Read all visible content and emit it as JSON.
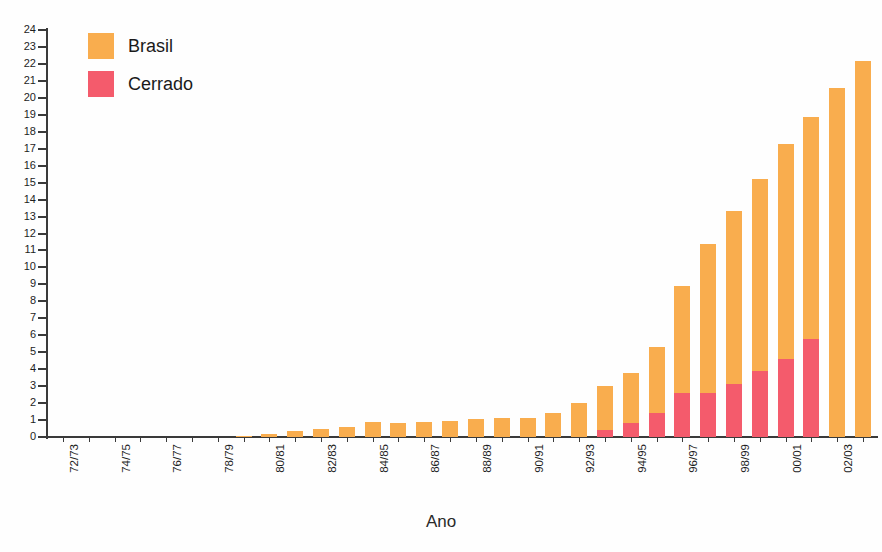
{
  "chart_data": {
    "type": "bar",
    "stacked": true,
    "title": "",
    "xlabel": "Ano",
    "ylabel": "",
    "ylim": [
      0,
      24
    ],
    "ytick_step": 1,
    "grid": false,
    "legend_position": "top-left",
    "categories": [
      "72/73",
      "73/74",
      "74/75",
      "75/76",
      "76/77",
      "77/78",
      "78/79",
      "79/80",
      "80/81",
      "81/82",
      "82/83",
      "83/84",
      "84/85",
      "85/86",
      "86/87",
      "87/88",
      "88/89",
      "89/90",
      "90/91",
      "91/92",
      "92/93",
      "93/94",
      "94/95",
      "95/96",
      "96/97",
      "97/98",
      "98/99",
      "99/00",
      "00/01",
      "01/02",
      "02/03",
      "03/04"
    ],
    "xtick_labels_shown": [
      "72/73",
      "74/75",
      "76/77",
      "78/79",
      "80/81",
      "82/83",
      "84/85",
      "86/87",
      "88/89",
      "90/91",
      "92/93",
      "94/95",
      "96/97",
      "98/99",
      "00/01",
      "02/03"
    ],
    "series": [
      {
        "name": "Brasil",
        "color": "#F9AD4E",
        "values": [
          0.0,
          0.0,
          0.0,
          0.0,
          0.0,
          0.0,
          0.0,
          0.05,
          0.2,
          0.35,
          0.5,
          0.6,
          0.9,
          0.85,
          0.9,
          0.95,
          1.05,
          1.1,
          1.15,
          1.4,
          2.0,
          3.0,
          3.8,
          5.3,
          8.9,
          11.4,
          13.3,
          15.2,
          17.3,
          18.9,
          20.6,
          22.2
        ]
      },
      {
        "name": "Cerrado",
        "color": "#F45B6C",
        "values": [
          0.0,
          0.0,
          0.0,
          0.0,
          0.0,
          0.0,
          0.0,
          0.0,
          0.0,
          0.0,
          0.0,
          0.0,
          0.0,
          0.0,
          0.0,
          0.0,
          0.0,
          0.0,
          0.0,
          0.0,
          0.0,
          0.4,
          0.8,
          1.4,
          2.6,
          2.6,
          3.1,
          3.9,
          4.6,
          5.8,
          0.0,
          0.0
        ]
      }
    ],
    "ytick_labels": [
      "0",
      "1",
      "2",
      "3",
      "4",
      "5",
      "6",
      "7",
      "8",
      "9",
      "10",
      "11",
      "12",
      "13",
      "14",
      "15",
      "16",
      "17",
      "18",
      "19",
      "20",
      "21",
      "22",
      "23",
      "24"
    ]
  },
  "legend": {
    "items": [
      {
        "label": "Brasil",
        "color": "#F9AD4E"
      },
      {
        "label": "Cerrado",
        "color": "#F45B6C"
      }
    ]
  },
  "axes": {
    "x_title": "Ano"
  }
}
